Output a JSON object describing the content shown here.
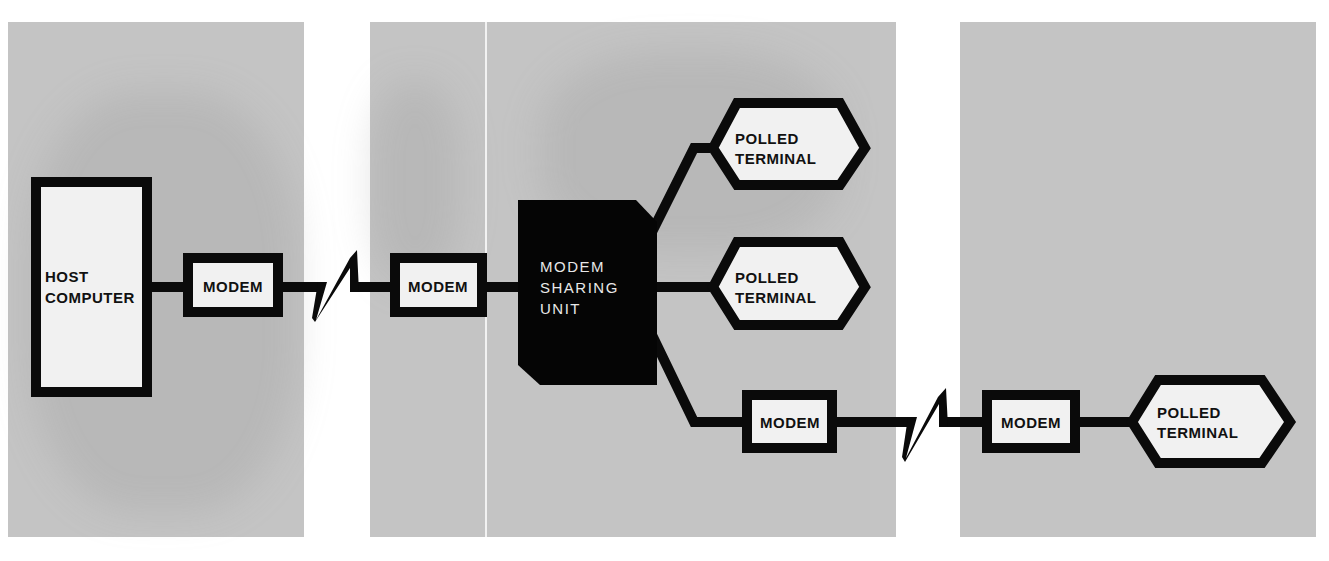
{
  "colors": {
    "background": "#ffffff",
    "panel": "#c4c4c4",
    "stroke": "#0a0a0a",
    "box_fill": "#f1f1f1",
    "unit_fill": "#050505",
    "unit_text": "#e8e8e8"
  },
  "panels": [
    {
      "id": "left",
      "x": 8,
      "y": 22,
      "w": 296,
      "h": 515
    },
    {
      "id": "center",
      "x": 370,
      "y": 22,
      "w": 526,
      "h": 515
    },
    {
      "id": "right",
      "x": 960,
      "y": 22,
      "w": 356,
      "h": 515
    }
  ],
  "nodes": {
    "host": {
      "label_lines": [
        "HOST",
        "COMPUTER"
      ]
    },
    "modem_1": {
      "label": "MODEM"
    },
    "modem_2": {
      "label": "MODEM"
    },
    "sharing_unit": {
      "label_lines": [
        "MODEM",
        "SHARING",
        "UNIT"
      ]
    },
    "terminal_1": {
      "label_lines": [
        "POLLED",
        "TERMINAL"
      ]
    },
    "terminal_2": {
      "label_lines": [
        "POLLED",
        "TERMINAL"
      ]
    },
    "modem_3": {
      "label": "MODEM"
    },
    "modem_4": {
      "label": "MODEM"
    },
    "terminal_3": {
      "label_lines": [
        "POLLED",
        "TERMINAL"
      ]
    }
  },
  "links": [
    {
      "from": "host",
      "to": "modem_1",
      "type": "direct"
    },
    {
      "from": "modem_1",
      "to": "modem_2",
      "type": "telephone-line-break"
    },
    {
      "from": "modem_2",
      "to": "sharing_unit",
      "type": "direct"
    },
    {
      "from": "sharing_unit",
      "to": "terminal_1",
      "type": "direct"
    },
    {
      "from": "sharing_unit",
      "to": "terminal_2",
      "type": "direct"
    },
    {
      "from": "sharing_unit",
      "to": "modem_3",
      "type": "direct"
    },
    {
      "from": "modem_3",
      "to": "modem_4",
      "type": "telephone-line-break"
    },
    {
      "from": "modem_4",
      "to": "terminal_3",
      "type": "direct"
    }
  ]
}
